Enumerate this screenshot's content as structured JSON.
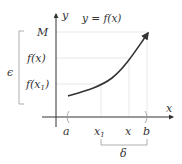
{
  "diagram": {
    "title": "y = f(x)",
    "axes": {
      "x_label": "x",
      "y_label": "y"
    },
    "y_labels": {
      "top": "M",
      "mid": "f(x)",
      "low": "f(x",
      "low_sub": "1",
      "low_close": ")"
    },
    "x_labels": {
      "a": "a",
      "x1": "x",
      "x1_sub": "1",
      "x": "x",
      "b": "b"
    },
    "brackets": {
      "epsilon": "ϵ",
      "delta": "δ"
    },
    "colors": {
      "ink": "#333333",
      "guide": "#dddddd",
      "bracket": "#999999"
    }
  }
}
